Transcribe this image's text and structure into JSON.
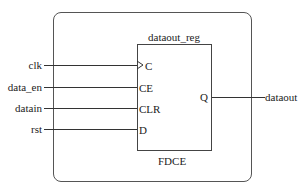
{
  "instance": {
    "name": "dataout_reg",
    "type": "FDCE"
  },
  "inputs": [
    {
      "net": "clk",
      "pin": "C",
      "clock": true
    },
    {
      "net": "data_en",
      "pin": "CE"
    },
    {
      "net": "datain",
      "pin": "CLR"
    },
    {
      "net": "rst",
      "pin": "D"
    }
  ],
  "outputs": [
    {
      "net": "dataout",
      "pin": "Q"
    }
  ]
}
